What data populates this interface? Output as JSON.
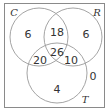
{
  "diagram": {
    "type": "venn-3",
    "sets": [
      {
        "id": "C",
        "label": "C"
      },
      {
        "id": "R",
        "label": "R"
      },
      {
        "id": "T",
        "label": "T"
      }
    ],
    "regions": {
      "C_only": "6",
      "R_only": "6",
      "T_only": "4",
      "C_R_only": "18",
      "C_T_only": "20",
      "R_T_only": "10",
      "C_R_T": "26",
      "none": "0"
    }
  }
}
